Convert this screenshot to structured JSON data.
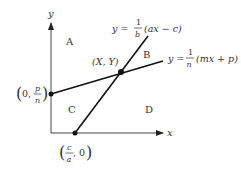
{
  "axes": {
    "x_label": "x",
    "y_label": "y"
  },
  "regions": {
    "A": "A",
    "B": "B",
    "C": "C",
    "D": "D"
  },
  "lines": {
    "steep": {
      "prefix": "y =",
      "frac_num": "1",
      "frac_den": "b",
      "expr": "(ax − c)"
    },
    "shallow": {
      "prefix": "y =",
      "frac_num": "1",
      "frac_den": "n",
      "expr": "(mx + p)"
    }
  },
  "points": {
    "intersection": "(X, Y)",
    "y_intercept": {
      "open": "(",
      "zero": "0,",
      "frac_num": "p",
      "frac_den": "n",
      "close": ")"
    },
    "x_intercept": {
      "open": "(",
      "frac_num": "c",
      "frac_den": "a",
      "zero": ", 0",
      "close": ")"
    }
  },
  "colors": {
    "line": "#111111",
    "axis": "#444444",
    "text": "#333333"
  }
}
